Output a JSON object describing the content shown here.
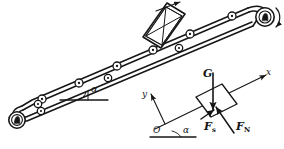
{
  "figure": {
    "background_color": "#ffffff",
    "line_color": "#161616"
  },
  "conveyor": {
    "name": "inclined-belt-conveyor",
    "incline_angle_label": "α",
    "belt_direction_arrow": "up-incline",
    "drive_pulley_rotation": "clockwise",
    "rollers_upper_count": 6,
    "rollers_lower_count": 4,
    "crate_label": "",
    "crate_bracing": "x-braced-crate"
  },
  "free_body": {
    "name": "free-body-diagram",
    "block_label": "",
    "angle_label": "α",
    "origin_label": "O",
    "axis_x_label": "x",
    "axis_y_label": "y",
    "forces": [
      {
        "symbol": "G",
        "subscript": "",
        "name": "gravity-force",
        "direction": "vertical-down"
      },
      {
        "symbol": "F",
        "subscript": "s",
        "name": "friction-force",
        "direction": "up-incline"
      },
      {
        "symbol": "F",
        "subscript": "N",
        "name": "normal-force",
        "direction": "perpendicular-to-incline"
      }
    ]
  },
  "labels": {
    "conveyor_alpha": "α",
    "fbd_alpha": "α",
    "origin": "O",
    "axis_x": "x",
    "axis_y": "y",
    "force_g": "G",
    "force_f": "F",
    "sub_s": "s",
    "sub_n": "N"
  }
}
